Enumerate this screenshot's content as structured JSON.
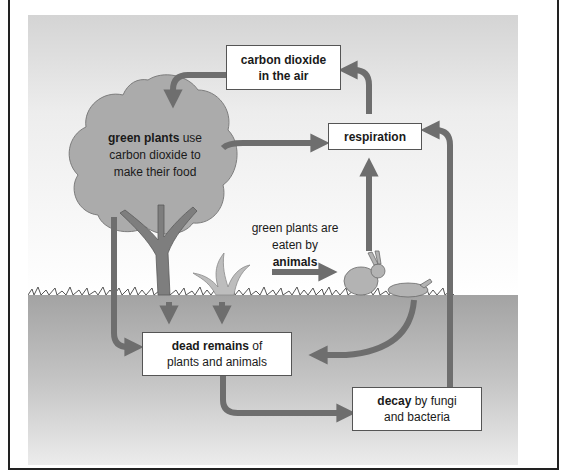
{
  "diagram": {
    "colors": {
      "arrow": "#6e6e6e",
      "sky_top": "#d8d8d8",
      "sky_bottom": "#ffffff",
      "ground": "#a6a6a6",
      "tree_canopy": "#a9a9a9",
      "tree_trunk": "#7a7a7a",
      "box_border": "#555555"
    },
    "nodes": {
      "co2_air": {
        "line1": "carbon dioxide",
        "line2": "in the air"
      },
      "respiration": {
        "label": "respiration"
      },
      "green_plants": {
        "bold": "green plants",
        "rest1": " use",
        "line2": "carbon dioxide to",
        "line3": "make their food"
      },
      "eaten": {
        "line1": "green plants are",
        "line2": "eaten by",
        "bold": "animals"
      },
      "dead_remains": {
        "bold": "dead remains",
        "rest1": " of",
        "line2": "plants and animals"
      },
      "decay": {
        "bold": "decay",
        "rest1": " by fungi",
        "line2": "and bacteria"
      }
    },
    "edges": [
      {
        "from": "carbon dioxide in the air",
        "to": "green plants"
      },
      {
        "from": "green plants",
        "to": "respiration"
      },
      {
        "from": "respiration",
        "to": "carbon dioxide in the air"
      },
      {
        "from": "animals",
        "to": "respiration"
      },
      {
        "from": "green plants",
        "to": "animals"
      },
      {
        "from": "tree",
        "to": "dead remains"
      },
      {
        "from": "plants",
        "to": "dead remains"
      },
      {
        "from": "dead animal",
        "to": "dead remains"
      },
      {
        "from": "dead remains",
        "to": "decay by fungi and bacteria"
      },
      {
        "from": "decay by fungi and bacteria",
        "to": "respiration"
      }
    ]
  }
}
